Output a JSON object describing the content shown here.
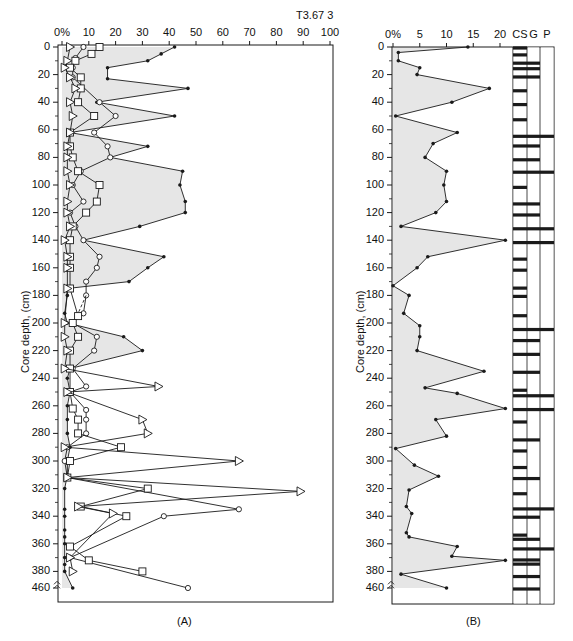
{
  "figure_title": "T3.67 3",
  "chart_data": [
    {
      "id": "A",
      "type": "line",
      "panel_label": "(A)",
      "title": "",
      "xlabel": "",
      "ylabel": "Core depth, (cm)",
      "x_tick_labels": [
        "0%",
        "10",
        "20",
        "30",
        "40",
        "50",
        "60",
        "70",
        "80",
        "90",
        "100"
      ],
      "x_ticks": [
        0,
        10,
        20,
        30,
        40,
        50,
        60,
        70,
        80,
        90,
        100
      ],
      "xlim": [
        0,
        100
      ],
      "y_tick_labels": [
        "0",
        "20",
        "40",
        "60",
        "80",
        "100",
        "120",
        "140",
        "160",
        "180",
        "200",
        "220",
        "240",
        "260",
        "280",
        "300",
        "320",
        "340",
        "360",
        "380",
        "460"
      ],
      "y_ticks": [
        0,
        20,
        40,
        60,
        80,
        100,
        120,
        140,
        160,
        180,
        200,
        220,
        240,
        260,
        280,
        300,
        320,
        340,
        360,
        380,
        460
      ],
      "ylim": [
        0,
        460
      ],
      "y_axis_break": [
        385,
        455
      ],
      "grid": false,
      "series": [
        {
          "name": "total (filled dots, shaded)",
          "marker": "dot",
          "style": "solid",
          "shaded": true,
          "points": [
            [
              0,
              42
            ],
            [
              5,
              37
            ],
            [
              10,
              32
            ],
            [
              15,
              17
            ],
            [
              23,
              17
            ],
            [
              30,
              47
            ],
            [
              40,
              13
            ],
            [
              50,
              42
            ],
            [
              62,
              3
            ],
            [
              72,
              32
            ],
            [
              80,
              18
            ],
            [
              90,
              45
            ],
            [
              100,
              44
            ],
            [
              112,
              46
            ],
            [
              120,
              46
            ],
            [
              130,
              29
            ],
            [
              140,
              8
            ],
            [
              152,
              38
            ],
            [
              160,
              32
            ],
            [
              170,
              25
            ],
            [
              175,
              2
            ],
            [
              180,
              2
            ],
            [
              193,
              1
            ],
            [
              200,
              2
            ],
            [
              210,
              23
            ],
            [
              220,
              30
            ],
            [
              233,
              3
            ],
            [
              240,
              2
            ],
            [
              250,
              3
            ],
            [
              260,
              2
            ],
            [
              270,
              2
            ],
            [
              280,
              2
            ],
            [
              290,
              3
            ],
            [
              300,
              2
            ],
            [
              310,
              2
            ],
            [
              320,
              1
            ],
            [
              335,
              1
            ],
            [
              340,
              1
            ],
            [
              350,
              1
            ],
            [
              355,
              1
            ],
            [
              360,
              1
            ],
            [
              370,
              1
            ],
            [
              375,
              1
            ],
            [
              380,
              1
            ],
            [
              460,
              4
            ]
          ]
        },
        {
          "name": "open circles",
          "marker": "circle",
          "style": "solid",
          "points": [
            [
              0,
              8
            ],
            [
              8,
              5
            ],
            [
              15,
              4
            ],
            [
              22,
              4
            ],
            [
              40,
              14
            ],
            [
              50,
              20
            ],
            [
              62,
              12
            ],
            [
              72,
              17
            ],
            [
              80,
              18
            ],
            [
              90,
              7
            ],
            [
              100,
              4
            ],
            [
              112,
              8
            ],
            [
              120,
              3
            ],
            [
              130,
              5
            ],
            [
              140,
              8
            ],
            [
              152,
              14
            ],
            [
              160,
              13
            ],
            [
              170,
              9
            ],
            [
              180,
              9
            ],
            [
              193,
              8
            ],
            [
              200,
              4
            ],
            [
              210,
              13
            ],
            [
              220,
              12
            ],
            [
              233,
              4
            ],
            [
              246,
              9
            ],
            [
              250,
              3
            ],
            [
              263,
              9
            ],
            [
              270,
              9
            ],
            [
              280,
              9
            ],
            [
              290,
              2
            ],
            [
              300,
              1
            ],
            [
              312,
              2
            ],
            [
              335,
              66
            ],
            [
              340,
              38
            ],
            [
              370,
              3
            ],
            [
              460,
              47
            ]
          ]
        },
        {
          "name": "squares",
          "marker": "square",
          "style": "solid",
          "points": [
            [
              0,
              14
            ],
            [
              5,
              11
            ],
            [
              10,
              5
            ],
            [
              15,
              3
            ],
            [
              22,
              7
            ],
            [
              30,
              7
            ],
            [
              40,
              6
            ],
            [
              50,
              12
            ],
            [
              62,
              3
            ],
            [
              72,
              3
            ],
            [
              80,
              4
            ],
            [
              90,
              6
            ],
            [
              100,
              14
            ],
            [
              112,
              13
            ],
            [
              120,
              9
            ],
            [
              130,
              4
            ],
            [
              140,
              3
            ],
            [
              152,
              3
            ],
            [
              160,
              3
            ],
            [
              175,
              3
            ],
            [
              195,
              6
            ],
            [
              200,
              4
            ],
            [
              210,
              6
            ],
            [
              220,
              3
            ],
            [
              233,
              3
            ],
            [
              250,
              3
            ],
            [
              262,
              4
            ],
            [
              270,
              6
            ],
            [
              280,
              6
            ],
            [
              290,
              22
            ],
            [
              300,
              3
            ],
            [
              312,
              2
            ],
            [
              320,
              32
            ],
            [
              333,
              7
            ],
            [
              340,
              24
            ],
            [
              362,
              3
            ],
            [
              372,
              10
            ],
            [
              380,
              30
            ]
          ]
        },
        {
          "name": "triangles",
          "marker": "triangle",
          "style": "solid",
          "points": [
            [
              0,
              3
            ],
            [
              10,
              2
            ],
            [
              15,
              1
            ],
            [
              22,
              3
            ],
            [
              30,
              5
            ],
            [
              40,
              3
            ],
            [
              50,
              4
            ],
            [
              62,
              3
            ],
            [
              72,
              2
            ],
            [
              80,
              2
            ],
            [
              90,
              2
            ],
            [
              100,
              3
            ],
            [
              112,
              2
            ],
            [
              120,
              2
            ],
            [
              130,
              3
            ],
            [
              140,
              1
            ],
            [
              152,
              2
            ],
            [
              160,
              2
            ],
            [
              175,
              2
            ],
            [
              200,
              1
            ],
            [
              210,
              1
            ],
            [
              220,
              2
            ],
            [
              233,
              1
            ],
            [
              246,
              36
            ],
            [
              250,
              2
            ],
            [
              270,
              30
            ],
            [
              280,
              32
            ],
            [
              290,
              1
            ],
            [
              300,
              66
            ],
            [
              312,
              2
            ],
            [
              322,
              89
            ],
            [
              333,
              6
            ],
            [
              338,
              19
            ],
            [
              370,
              3
            ],
            [
              380,
              4
            ]
          ]
        },
        {
          "name": "dashed connectors",
          "marker": "none",
          "style": "dashed",
          "points": [
            [
              180,
              9
            ],
            [
              193,
              6
            ]
          ]
        }
      ]
    },
    {
      "id": "B",
      "type": "area",
      "panel_label": "(B)",
      "title": "",
      "xlabel": "",
      "ylabel": "Core depth, (cm)",
      "x_tick_labels": [
        "0%",
        "5",
        "10",
        "15",
        "20"
      ],
      "x_ticks": [
        0,
        5,
        10,
        15,
        20
      ],
      "xlim": [
        0,
        20
      ],
      "y_tick_labels": [
        "0",
        "20",
        "40",
        "60",
        "80",
        "100",
        "120",
        "140",
        "160",
        "180",
        "200",
        "220",
        "240",
        "260",
        "280",
        "300",
        "320",
        "340",
        "360",
        "380",
        "460"
      ],
      "y_ticks": [
        0,
        20,
        40,
        60,
        80,
        100,
        120,
        140,
        160,
        180,
        200,
        220,
        240,
        260,
        280,
        300,
        320,
        340,
        360,
        380,
        460
      ],
      "ylim": [
        0,
        460
      ],
      "y_axis_break": [
        385,
        455
      ],
      "grid": false,
      "series": [
        {
          "name": "percent",
          "marker": "dot",
          "style": "solid",
          "shaded": true,
          "points": [
            [
              0,
              14
            ],
            [
              4,
              1
            ],
            [
              10,
              1
            ],
            [
              15,
              5
            ],
            [
              20,
              4.5
            ],
            [
              30,
              18
            ],
            [
              40,
              11
            ],
            [
              50,
              0.5
            ],
            [
              62,
              12
            ],
            [
              70,
              7.5
            ],
            [
              80,
              6
            ],
            [
              90,
              10
            ],
            [
              100,
              9.5
            ],
            [
              112,
              10
            ],
            [
              120,
              8
            ],
            [
              130,
              1.5
            ],
            [
              140,
              21
            ],
            [
              152,
              6.5
            ],
            [
              160,
              4.5
            ],
            [
              173,
              0
            ],
            [
              180,
              3
            ],
            [
              193,
              2
            ],
            [
              202,
              5
            ],
            [
              210,
              5
            ],
            [
              220,
              4.5
            ],
            [
              235,
              17
            ],
            [
              247,
              6
            ],
            [
              251,
              12
            ],
            [
              262,
              21
            ],
            [
              270,
              8
            ],
            [
              282,
              10
            ],
            [
              291,
              0.5
            ],
            [
              303,
              4
            ],
            [
              311,
              8.5
            ],
            [
              321,
              3
            ],
            [
              333,
              2.5
            ],
            [
              338,
              3.5
            ],
            [
              352,
              2.5
            ],
            [
              355,
              3
            ],
            [
              362,
              12
            ],
            [
              369,
              11
            ],
            [
              372,
              21
            ],
            [
              382,
              1.5
            ],
            [
              460,
              10
            ]
          ]
        }
      ],
      "strip_columns": [
        "CS",
        "G",
        "P"
      ],
      "strip_bars": [
        {
          "depth": 0,
          "cols": 1
        },
        {
          "depth": 5,
          "cols": 1
        },
        {
          "depth": 11,
          "cols": 2
        },
        {
          "depth": 15,
          "cols": 2
        },
        {
          "depth": 21,
          "cols": 2
        },
        {
          "depth": 31,
          "cols": 1
        },
        {
          "depth": 41,
          "cols": 1
        },
        {
          "depth": 52,
          "cols": 1
        },
        {
          "depth": 64,
          "cols": 3
        },
        {
          "depth": 71,
          "cols": 2
        },
        {
          "depth": 81,
          "cols": 2
        },
        {
          "depth": 90,
          "cols": 3
        },
        {
          "depth": 101,
          "cols": 1
        },
        {
          "depth": 113,
          "cols": 2
        },
        {
          "depth": 121,
          "cols": 2
        },
        {
          "depth": 131,
          "cols": 3
        },
        {
          "depth": 141,
          "cols": 3
        },
        {
          "depth": 153,
          "cols": 1
        },
        {
          "depth": 161,
          "cols": 1
        },
        {
          "depth": 174,
          "cols": 1
        },
        {
          "depth": 180,
          "cols": 1
        },
        {
          "depth": 194,
          "cols": 1
        },
        {
          "depth": 204,
          "cols": 3
        },
        {
          "depth": 212,
          "cols": 2
        },
        {
          "depth": 222,
          "cols": 2
        },
        {
          "depth": 235,
          "cols": 2
        },
        {
          "depth": 248,
          "cols": 1
        },
        {
          "depth": 252,
          "cols": 3
        },
        {
          "depth": 262,
          "cols": 3
        },
        {
          "depth": 271,
          "cols": 1
        },
        {
          "depth": 284,
          "cols": 2
        },
        {
          "depth": 292,
          "cols": 1
        },
        {
          "depth": 304,
          "cols": 1
        },
        {
          "depth": 312,
          "cols": 2
        },
        {
          "depth": 323,
          "cols": 1
        },
        {
          "depth": 334,
          "cols": 3
        },
        {
          "depth": 340,
          "cols": 2
        },
        {
          "depth": 353,
          "cols": 1
        },
        {
          "depth": 356,
          "cols": 2
        },
        {
          "depth": 363,
          "cols": 3
        },
        {
          "depth": 371,
          "cols": 2
        },
        {
          "depth": 374,
          "cols": 2
        },
        {
          "depth": 383,
          "cols": 2
        },
        {
          "depth": 460,
          "cols": 2
        }
      ]
    }
  ],
  "colors": {
    "ink": "#1a1a1a",
    "shade": "#e6e6e6",
    "background": "#ffffff"
  }
}
